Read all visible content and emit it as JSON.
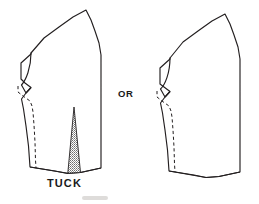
{
  "figure": {
    "background_color": "#ffffff",
    "ink_color": "#231f20",
    "shading_color": "#8a8a8a",
    "width": 259,
    "height": 204
  },
  "labels": {
    "tuck": "TUCK",
    "or": "OR"
  },
  "left_piece": {
    "name": "pattern-piece-with-tuck",
    "outline_points": "22,62 32,52 44,38 58,29 74,20 86,12 92,21 96,32 101,44 102,60 102,96 102,128 102,160 103,168 66,174 29,168 27,150 25,128 23,110 21,98 25,92 31,86 22,78 22,70",
    "has_tuck": true,
    "has_dashed_seam": true,
    "tuck": {
      "apex_x": 74,
      "apex_y": 108,
      "base_left_x": 69,
      "base_left_y": 172,
      "base_right_x": 79,
      "base_right_y": 172,
      "shaded": true
    }
  },
  "right_piece": {
    "name": "pattern-piece-plain",
    "has_tuck": false,
    "has_dashed_seam": true
  }
}
